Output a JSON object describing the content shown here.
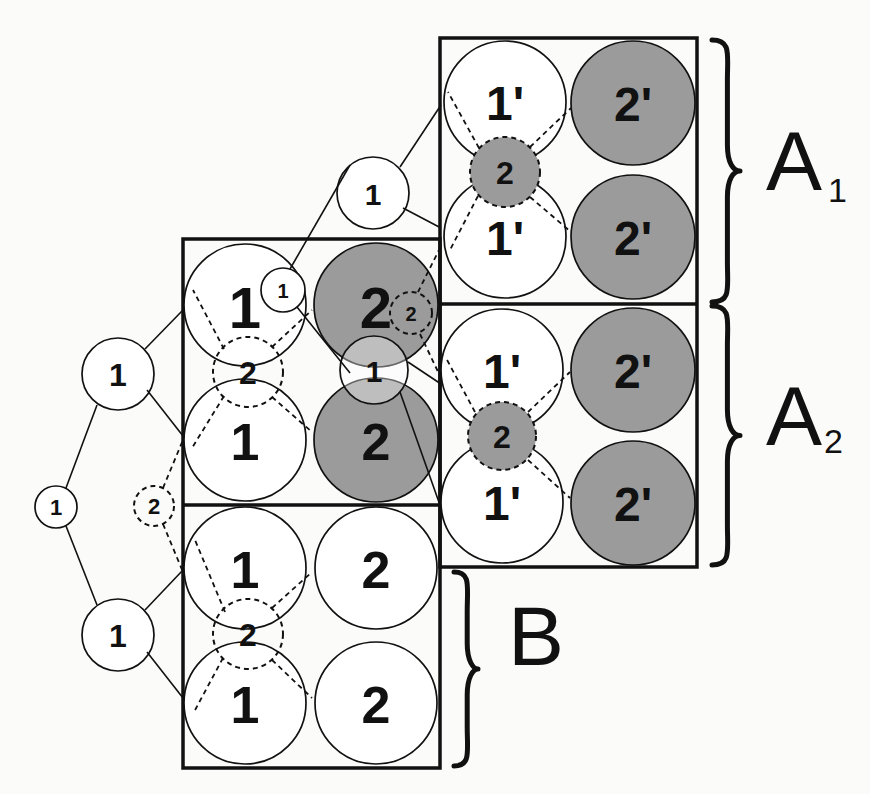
{
  "colors": {
    "shaded": "#9b9b9b",
    "white": "#ffffff",
    "ink": "#111111"
  },
  "boxes": [
    {
      "name": "box-a",
      "x": 440,
      "y": 38,
      "w": 257,
      "h": 529,
      "divider_y": 304
    },
    {
      "name": "box-left",
      "x": 183,
      "y": 239,
      "w": 257,
      "h": 529,
      "divider_y": 505
    }
  ],
  "edges": [
    {
      "name": "edge-root-upper",
      "x1": 66,
      "y1": 488,
      "x2": 97,
      "y2": 405,
      "dashed": false
    },
    {
      "name": "edge-root-lower",
      "x1": 66,
      "y1": 526,
      "x2": 97,
      "y2": 605,
      "dashed": false
    },
    {
      "name": "edge-upper-box-top",
      "x1": 145,
      "y1": 349,
      "x2": 183,
      "y2": 310,
      "dashed": false
    },
    {
      "name": "edge-upper-box-bottom",
      "x1": 147,
      "y1": 390,
      "x2": 183,
      "y2": 436,
      "dashed": false
    },
    {
      "name": "edge-lower-box-top",
      "x1": 145,
      "y1": 610,
      "x2": 183,
      "y2": 570,
      "dashed": false
    },
    {
      "name": "edge-lower-box-bottom",
      "x1": 147,
      "y1": 652,
      "x2": 183,
      "y2": 698,
      "dashed": false
    },
    {
      "name": "edge-dashed2-up",
      "x1": 163,
      "y1": 488,
      "x2": 183,
      "y2": 440,
      "dashed": true
    },
    {
      "name": "edge-dashed2-down",
      "x1": 163,
      "y1": 524,
      "x2": 183,
      "y2": 572,
      "dashed": true
    },
    {
      "name": "edge-small1-topnode",
      "x1": 290,
      "y1": 269,
      "x2": 350,
      "y2": 165,
      "dashed": false
    },
    {
      "name": "edge-topnode-box-top",
      "x1": 400,
      "y1": 167,
      "x2": 441,
      "y2": 105,
      "dashed": false
    },
    {
      "name": "edge-topnode-box-bottom",
      "x1": 403,
      "y1": 208,
      "x2": 441,
      "y2": 228,
      "dashed": false
    },
    {
      "name": "edge-small1-mid1",
      "x1": 297,
      "y1": 307,
      "x2": 350,
      "y2": 373,
      "dashed": false
    },
    {
      "name": "edge-mid1-box-top",
      "x1": 408,
      "y1": 362,
      "x2": 441,
      "y2": 384,
      "dashed": false
    },
    {
      "name": "edge-mid1-box-bottom",
      "x1": 400,
      "y1": 392,
      "x2": 441,
      "y2": 508,
      "dashed": false
    },
    {
      "name": "edge-left-dashed-up",
      "x1": 272,
      "y1": 347,
      "x2": 312,
      "y2": 310,
      "dashed": true
    },
    {
      "name": "edge-left-dashed-down",
      "x1": 272,
      "y1": 397,
      "x2": 312,
      "y2": 432,
      "dashed": true
    },
    {
      "name": "edge-b-dashed-up",
      "x1": 272,
      "y1": 608,
      "x2": 312,
      "y2": 572,
      "dashed": true
    },
    {
      "name": "edge-b-dashed-down",
      "x1": 272,
      "y1": 660,
      "x2": 312,
      "y2": 698,
      "dashed": true
    },
    {
      "name": "edge-b-dashed-left-up",
      "x1": 225,
      "y1": 612,
      "x2": 195,
      "y2": 540,
      "dashed": true
    },
    {
      "name": "edge-b-dashed-left-down",
      "x1": 223,
      "y1": 658,
      "x2": 194,
      "y2": 712,
      "dashed": true
    },
    {
      "name": "edge-left-dashed-left-up",
      "x1": 224,
      "y1": 349,
      "x2": 193,
      "y2": 290,
      "dashed": true
    },
    {
      "name": "edge-left-dashed-left-down",
      "x1": 224,
      "y1": 396,
      "x2": 192,
      "y2": 448,
      "dashed": true
    },
    {
      "name": "edge-small2-up",
      "x1": 418,
      "y1": 292,
      "x2": 440,
      "y2": 248,
      "dashed": true
    },
    {
      "name": "edge-small2-down",
      "x1": 420,
      "y1": 334,
      "x2": 441,
      "y2": 378,
      "dashed": true
    },
    {
      "name": "edge-a1-dashed-up",
      "x1": 530,
      "y1": 147,
      "x2": 571,
      "y2": 108,
      "dashed": true
    },
    {
      "name": "edge-a1-dashed-down",
      "x1": 530,
      "y1": 197,
      "x2": 571,
      "y2": 232,
      "dashed": true
    },
    {
      "name": "edge-a1-dashed-left-up",
      "x1": 479,
      "y1": 148,
      "x2": 448,
      "y2": 92,
      "dashed": true
    },
    {
      "name": "edge-a1-dashed-left-down",
      "x1": 478,
      "y1": 196,
      "x2": 450,
      "y2": 250,
      "dashed": true
    },
    {
      "name": "edge-a2-dashed-up",
      "x1": 528,
      "y1": 412,
      "x2": 570,
      "y2": 372,
      "dashed": true
    },
    {
      "name": "edge-a2-dashed-down",
      "x1": 528,
      "y1": 460,
      "x2": 570,
      "y2": 498,
      "dashed": true
    },
    {
      "name": "edge-a2-dashed-left-up",
      "x1": 475,
      "y1": 412,
      "x2": 446,
      "y2": 358,
      "dashed": true
    }
  ],
  "circles": [
    {
      "name": "a1-node-1prime-top",
      "cx": 505,
      "cy": 102,
      "r": 61,
      "label": "1'",
      "fill": "white",
      "dashed": false,
      "size": 48
    },
    {
      "name": "a1-node-2prime-top",
      "cx": 633,
      "cy": 103,
      "r": 62,
      "label": "2'",
      "fill": "shaded",
      "dashed": false,
      "size": 48
    },
    {
      "name": "a1-node-1prime-bottom",
      "cx": 505,
      "cy": 237,
      "r": 61,
      "label": "1'",
      "fill": "white",
      "dashed": false,
      "size": 48
    },
    {
      "name": "a1-node-2prime-bottom",
      "cx": 633,
      "cy": 237,
      "r": 62,
      "label": "2'",
      "fill": "shaded",
      "dashed": false,
      "size": 48
    },
    {
      "name": "a1-node-2-shared",
      "cx": 505,
      "cy": 172,
      "r": 35,
      "label": "2",
      "fill": "shaded",
      "dashed": true,
      "size": 32
    },
    {
      "name": "a2-node-1prime-top",
      "cx": 502,
      "cy": 370,
      "r": 61,
      "label": "1'",
      "fill": "white",
      "dashed": false,
      "size": 48
    },
    {
      "name": "a2-node-2prime-top",
      "cx": 633,
      "cy": 370,
      "r": 62,
      "label": "2'",
      "fill": "shaded",
      "dashed": false,
      "size": 48
    },
    {
      "name": "a2-node-1prime-bottom",
      "cx": 502,
      "cy": 502,
      "r": 61,
      "label": "1'",
      "fill": "white",
      "dashed": false,
      "size": 48
    },
    {
      "name": "a2-node-2prime-bottom",
      "cx": 633,
      "cy": 503,
      "r": 62,
      "label": "2'",
      "fill": "shaded",
      "dashed": false,
      "size": 48
    },
    {
      "name": "a2-node-2-shared",
      "cx": 502,
      "cy": 436,
      "r": 34,
      "label": "2",
      "fill": "shaded",
      "dashed": true,
      "size": 32
    },
    {
      "name": "left-node-1-top",
      "cx": 245,
      "cy": 305,
      "r": 61,
      "label": "1",
      "fill": "white",
      "dashed": false,
      "size": 58
    },
    {
      "name": "left-node-2-top",
      "cx": 376,
      "cy": 305,
      "r": 62,
      "label": "2",
      "fill": "shaded",
      "dashed": false,
      "size": 58
    },
    {
      "name": "left-node-1-bottom",
      "cx": 245,
      "cy": 440,
      "r": 61,
      "label": "1",
      "fill": "white",
      "dashed": false,
      "size": 52
    },
    {
      "name": "left-node-2-bottom",
      "cx": 376,
      "cy": 440,
      "r": 62,
      "label": "2",
      "fill": "shaded",
      "dashed": false,
      "size": 52
    },
    {
      "name": "left-node-2-dashed",
      "cx": 248,
      "cy": 372,
      "r": 35,
      "label": "2",
      "fill": "none",
      "dashed": true,
      "size": 32
    },
    {
      "name": "left-node-1-small",
      "cx": 283,
      "cy": 290,
      "r": 22,
      "label": "1",
      "fill": "white",
      "dashed": false,
      "size": 20
    },
    {
      "name": "left-node-2-small-dashed",
      "cx": 411,
      "cy": 313,
      "r": 21,
      "label": "2",
      "fill": "none",
      "dashed": true,
      "size": 20
    },
    {
      "name": "left-node-1-mid",
      "cx": 374,
      "cy": 370,
      "r": 34,
      "label": "1",
      "fill": "translucent",
      "dashed": false,
      "size": 30
    },
    {
      "name": "b-node-1-top",
      "cx": 245,
      "cy": 568,
      "r": 61,
      "label": "1",
      "fill": "white",
      "dashed": false,
      "size": 52
    },
    {
      "name": "b-node-2-top",
      "cx": 376,
      "cy": 568,
      "r": 61,
      "label": "2",
      "fill": "white",
      "dashed": false,
      "size": 52
    },
    {
      "name": "b-node-1-bottom",
      "cx": 245,
      "cy": 703,
      "r": 61,
      "label": "1",
      "fill": "white",
      "dashed": false,
      "size": 52
    },
    {
      "name": "b-node-2-bottom",
      "cx": 376,
      "cy": 703,
      "r": 61,
      "label": "2",
      "fill": "white",
      "dashed": false,
      "size": 52
    },
    {
      "name": "b-node-2-dashed",
      "cx": 248,
      "cy": 634,
      "r": 35,
      "label": "2",
      "fill": "none",
      "dashed": true,
      "size": 32
    },
    {
      "name": "tree-node-root",
      "cx": 56,
      "cy": 507,
      "r": 21,
      "label": "1",
      "fill": "white",
      "dashed": false,
      "size": 22
    },
    {
      "name": "tree-node-upper",
      "cx": 118,
      "cy": 374,
      "r": 36,
      "label": "1",
      "fill": "white",
      "dashed": false,
      "size": 32
    },
    {
      "name": "tree-node-lower",
      "cx": 118,
      "cy": 635,
      "r": 36,
      "label": "1",
      "fill": "white",
      "dashed": false,
      "size": 32
    },
    {
      "name": "tree-node-dashed-2",
      "cx": 154,
      "cy": 506,
      "r": 20,
      "label": "2",
      "fill": "none",
      "dashed": true,
      "size": 22
    },
    {
      "name": "tree-node-top",
      "cx": 373,
      "cy": 193,
      "r": 36,
      "label": "1",
      "fill": "white",
      "dashed": false,
      "size": 30
    }
  ],
  "braces": [
    {
      "name": "brace-a1",
      "x": 712,
      "y1": 40,
      "y2": 302,
      "tip": 740
    },
    {
      "name": "brace-a2",
      "x": 712,
      "y1": 306,
      "y2": 565,
      "tip": 740
    },
    {
      "name": "brace-b",
      "x": 454,
      "y1": 572,
      "y2": 766,
      "tip": 478
    }
  ],
  "group_labels": [
    {
      "name": "label-a1",
      "text": "A",
      "sub": "1",
      "x": 766,
      "y": 190,
      "size": 84,
      "sub_size": 34,
      "sub_dx": 62,
      "sub_dy": 12
    },
    {
      "name": "label-a2",
      "text": "A",
      "sub": "2",
      "x": 766,
      "y": 445,
      "size": 84,
      "sub_size": 34,
      "sub_dx": 58,
      "sub_dy": 8
    },
    {
      "name": "label-b",
      "text": "B",
      "sub": "",
      "x": 508,
      "y": 665,
      "size": 84,
      "sub_size": 0,
      "sub_dx": 0,
      "sub_dy": 0
    }
  ]
}
